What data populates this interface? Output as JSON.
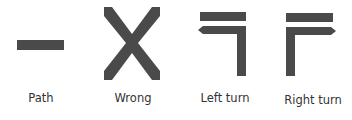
{
  "figure": {
    "symbol_color": "#4a4a4a",
    "items": [
      {
        "id": "path",
        "label": "Path",
        "icon": "path-bar-icon"
      },
      {
        "id": "wrong",
        "label": "Wrong",
        "icon": "x-cross-icon"
      },
      {
        "id": "left_turn",
        "label": "Left turn",
        "icon": "left-turn-icon"
      },
      {
        "id": "right_turn",
        "label": "Right turn",
        "icon": "right-turn-icon"
      }
    ]
  }
}
